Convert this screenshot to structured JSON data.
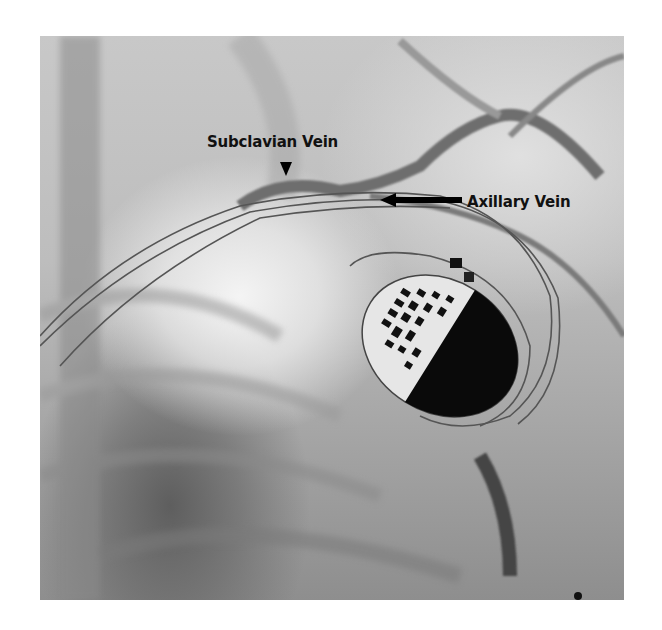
{
  "image": {
    "description": "Fluoroscopic venogram of the left chest showing an implanted cardiac pacemaker with leads passing through the subclavian and axillary veins",
    "background_color": "#ffffff"
  },
  "annotations": {
    "subclavian": {
      "label": "Subclavian Vein",
      "marker": "arrowhead-down"
    },
    "axillary": {
      "label": "Axillary Vein",
      "marker": "arrow-left"
    }
  }
}
